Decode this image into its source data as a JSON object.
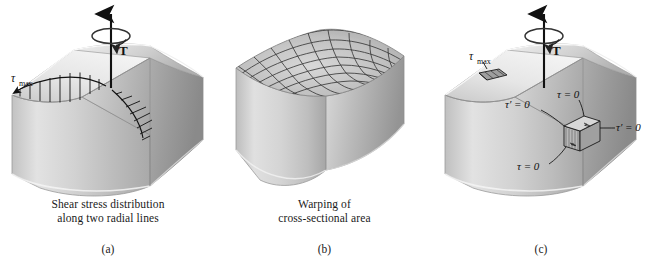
{
  "figure": {
    "background_color": "#ffffff",
    "ink_color": "#111111"
  },
  "panels": [
    {
      "id": "a",
      "sublabel": "(a)",
      "caption_line1": "Shear stress distribution",
      "caption_line2": "along two radial lines",
      "torque_label": "T",
      "labels": [
        {
          "name": "tau-max",
          "tex": "τ",
          "sub": "max"
        }
      ]
    },
    {
      "id": "b",
      "sublabel": "(b)",
      "caption_line1": "Warping of",
      "caption_line2": "cross-sectional area",
      "torque_label": "",
      "labels": []
    },
    {
      "id": "c",
      "sublabel": "(c)",
      "caption_line1": "",
      "caption_line2": "",
      "torque_label": "T",
      "labels": [
        {
          "name": "tau-max",
          "tex": "τ",
          "sub": "max"
        },
        {
          "name": "tau-prime-zero-left",
          "tex": "τ′ = 0"
        },
        {
          "name": "tau-zero-top",
          "tex": "τ = 0"
        },
        {
          "name": "tau-prime-zero-right",
          "tex": "τ′ = 0"
        },
        {
          "name": "tau-zero-bottom",
          "tex": "τ = 0"
        }
      ]
    }
  ],
  "colors": {
    "face_front_light": "#dedede",
    "face_front_dark": "#a8a8a8",
    "face_right_light": "#cfcfcf",
    "face_right_dark": "#8f8f8f",
    "face_top_light": "#f0f0f0",
    "face_top_dark": "#b4b4b4",
    "mesh_line": "#2a2a2a",
    "outline": "#1a1a1a"
  }
}
